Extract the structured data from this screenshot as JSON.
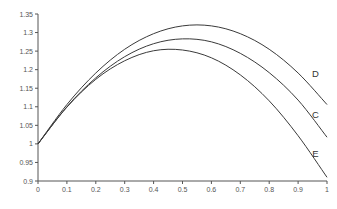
{
  "chart_data": {
    "type": "line",
    "title": "",
    "xlabel": "",
    "ylabel": "",
    "xlim": [
      0,
      1
    ],
    "ylim": [
      0.9,
      1.35
    ],
    "grid": false,
    "legend": "none (series labeled inline at right end of curves)",
    "x_ticks": [
      "0",
      "0.1",
      "0.2",
      "0.3",
      "0.4",
      "0.5",
      "0.6",
      "0.7",
      "0.8",
      "0.9",
      "1"
    ],
    "y_ticks": [
      "0.9",
      "0.95",
      "1",
      "1.05",
      "1.1",
      "1.15",
      "1.2",
      "1.25",
      "1.3",
      "1.35"
    ],
    "x": [
      0,
      0.1,
      0.2,
      0.3,
      0.4,
      0.5,
      0.6,
      0.7,
      0.8,
      0.9,
      1.0
    ],
    "series": [
      {
        "name": "D",
        "values": [
          1.0,
          1.106,
          1.191,
          1.255,
          1.297,
          1.318,
          1.318,
          1.297,
          1.255,
          1.191,
          1.106
        ]
      },
      {
        "name": "C",
        "values": [
          1.0,
          1.1,
          1.178,
          1.235,
          1.27,
          1.283,
          1.275,
          1.244,
          1.192,
          1.118,
          1.018
        ]
      },
      {
        "name": "E",
        "values": [
          1.0,
          1.099,
          1.174,
          1.224,
          1.251,
          1.253,
          1.232,
          1.186,
          1.116,
          1.022,
          0.91
        ]
      }
    ],
    "annotations": [
      {
        "text": "D",
        "x": 0.96,
        "y": 1.19
      },
      {
        "text": "C",
        "x": 0.96,
        "y": 1.08
      },
      {
        "text": "E",
        "x": 0.96,
        "y": 0.975
      }
    ]
  }
}
